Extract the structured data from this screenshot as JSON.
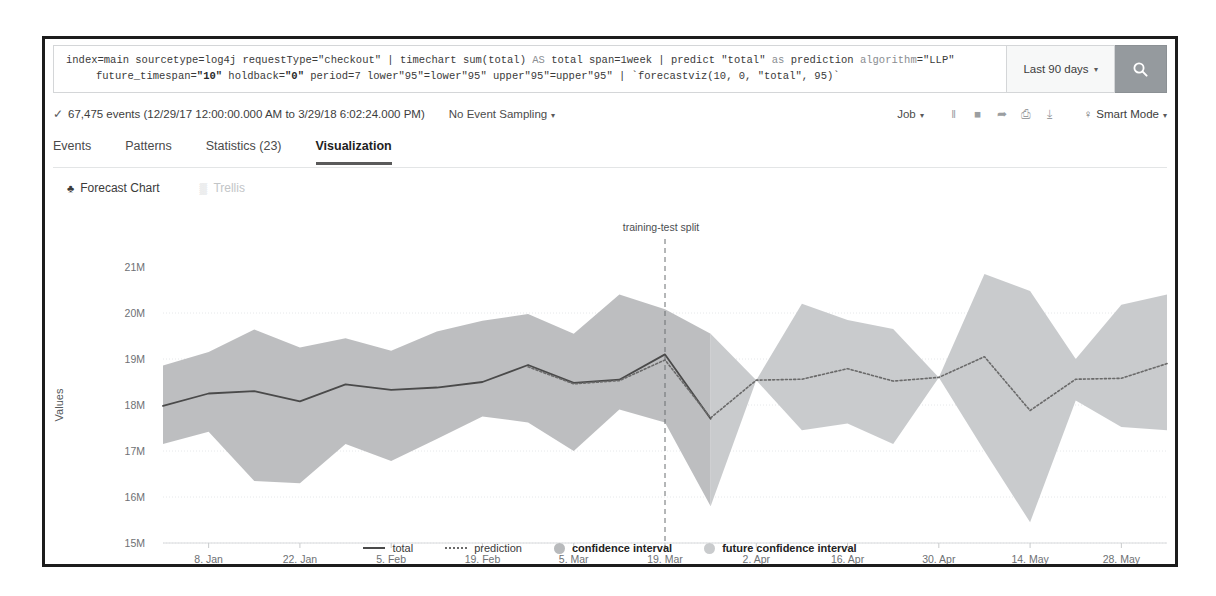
{
  "search": {
    "query_line1_parts": [
      {
        "t": "index=main sourcetype=log4j requestType=\"checkout\" | timechart sum(total) ",
        "c": "normal"
      },
      {
        "t": "AS",
        "c": "kw"
      },
      {
        "t": " total span=1week | predict \"total\" ",
        "c": "normal"
      },
      {
        "t": "as",
        "c": "kw"
      },
      {
        "t": " prediction ",
        "c": "normal"
      },
      {
        "t": "algorithm",
        "c": "kw"
      },
      {
        "t": "=\"LLP\"",
        "c": "normal"
      }
    ],
    "query_line2_parts": [
      {
        "t": "future_timespan=",
        "c": "normal"
      },
      {
        "t": "\"10\"",
        "c": "str"
      },
      {
        "t": " holdback=",
        "c": "normal"
      },
      {
        "t": "\"0\"",
        "c": "str"
      },
      {
        "t": " period=7 lower\"95\"=lower\"95\" upper\"95\"=upper\"95\" | `forecastviz(10, 0, \"total\", 95)`",
        "c": "normal"
      }
    ],
    "query_full": "index=main sourcetype=log4j requestType=\"checkout\" | timechart sum(total) AS total span=1week | predict \"total\" as prediction algorithm=\"LLP\" future_timespan=\"10\" holdback=\"0\" period=7 lower\"95\"=lower\"95\" upper\"95\"=upper\"95\" | `forecastviz(10, 0, \"total\", 95)`",
    "time_range_label": "Last 90 days",
    "time_range_caret": "▾",
    "search_icon": "magnifier-icon"
  },
  "jobbar": {
    "check_glyph": "✓",
    "events_text": "67,475 events (12/29/17 12:00:00.000 AM to 3/29/18 6:02:24.000 PM)",
    "sampling_label": "No Event Sampling",
    "sampling_caret": "▾",
    "job_label": "Job",
    "job_caret": "▾",
    "icons": [
      {
        "name": "pause-icon",
        "glyph": "‖"
      },
      {
        "name": "stop-icon",
        "glyph": "■"
      },
      {
        "name": "share-icon",
        "glyph": "➦"
      },
      {
        "name": "print-icon",
        "glyph": "⎙"
      },
      {
        "name": "export-icon",
        "glyph": "⤓"
      }
    ],
    "mode_bulb": "♀",
    "mode_label": "Smart Mode",
    "mode_caret": "▾"
  },
  "tabs": [
    {
      "label": "Events",
      "active": false
    },
    {
      "label": "Patterns",
      "active": false
    },
    {
      "label": "Statistics (23)",
      "active": false
    },
    {
      "label": "Visualization",
      "active": true
    }
  ],
  "chart_tools": [
    {
      "label": "Forecast Chart",
      "icon": "forecast-chart-icon",
      "glyph": "♣",
      "muted": false
    },
    {
      "label": "Trellis",
      "icon": "trellis-grid-icon",
      "glyph": "▒",
      "muted": true
    }
  ],
  "legend": [
    {
      "label": "total",
      "kind": "line",
      "bold": false
    },
    {
      "label": "prediction",
      "kind": "dashed",
      "bold": false
    },
    {
      "label": "confidence interval",
      "kind": "dot",
      "bold": true
    },
    {
      "label": "future confidence interval",
      "kind": "dot-future",
      "bold": true
    }
  ],
  "chart_data": {
    "type": "line",
    "title": "",
    "xlabel": "",
    "ylabel": "Values",
    "ylim": [
      15000000,
      21000000
    ],
    "ytick_labels": [
      "21M",
      "20M",
      "19M",
      "18M",
      "17M",
      "16M",
      "15M"
    ],
    "ytick_values": [
      21000000,
      20000000,
      19000000,
      18000000,
      17000000,
      16000000,
      15000000
    ],
    "xtick_labels": [
      "8. Jan",
      "22. Jan",
      "5. Feb",
      "19. Feb",
      "5. Mar",
      "19. Mar",
      "2. Apr",
      "16. Apr",
      "30. Apr",
      "14. May",
      "28. May"
    ],
    "xtick_index": [
      1,
      3,
      5,
      7,
      9,
      11,
      13,
      15,
      17,
      19,
      21
    ],
    "grid": true,
    "legend_position": "bottom",
    "annotations": [
      {
        "text": "training-test split",
        "x_index": 11.0,
        "type": "vline-dashed"
      }
    ],
    "x": [
      "2017-12-25",
      "2018-01-01",
      "2018-01-08",
      "2018-01-15",
      "2018-01-22",
      "2018-01-29",
      "2018-02-05",
      "2018-02-12",
      "2018-02-19",
      "2018-02-26",
      "2018-03-05",
      "2018-03-12",
      "2018-03-19",
      "2018-03-26",
      "2018-04-02",
      "2018-04-09",
      "2018-04-16",
      "2018-04-23",
      "2018-04-30",
      "2018-05-07",
      "2018-05-14",
      "2018-05-21",
      "2018-05-28"
    ],
    "series": [
      {
        "name": "total",
        "style": "solid",
        "values": [
          17980000,
          18250000,
          18300000,
          18080000,
          18450000,
          18330000,
          18380000,
          18500000,
          18870000,
          18480000,
          18550000,
          19100000,
          17700000,
          null,
          null,
          null,
          null,
          null,
          null,
          null,
          null,
          null,
          null
        ]
      },
      {
        "name": "prediction",
        "style": "dotted",
        "values": [
          null,
          null,
          null,
          null,
          null,
          null,
          null,
          null,
          18830000,
          18460000,
          18530000,
          18980000,
          17720000,
          18540000,
          18560000,
          18790000,
          18520000,
          18600000,
          19050000,
          17880000,
          18560000,
          18580000,
          18900000
        ]
      }
    ],
    "bands": [
      {
        "name": "confidence interval",
        "fill": "#b9bbbd",
        "lower": [
          17150000,
          17420000,
          16350000,
          16300000,
          17150000,
          16780000,
          17260000,
          17750000,
          17620000,
          17000000,
          17900000,
          17620000,
          15800000,
          null,
          null,
          null,
          null,
          null,
          null,
          null,
          null,
          null,
          null
        ],
        "upper": [
          18860000,
          19150000,
          19640000,
          19250000,
          19450000,
          19180000,
          19600000,
          19830000,
          19980000,
          19550000,
          20400000,
          20080000,
          19550000,
          null,
          null,
          null,
          null,
          null,
          null,
          null,
          null,
          null,
          null
        ]
      },
      {
        "name": "future confidence interval",
        "fill": "#c6c8ca",
        "lower": [
          null,
          null,
          null,
          null,
          null,
          null,
          null,
          null,
          null,
          null,
          null,
          null,
          15800000,
          18540000,
          17450000,
          17600000,
          17150000,
          18600000,
          17000000,
          15450000,
          18100000,
          17520000,
          17450000
        ],
        "upper": [
          null,
          null,
          null,
          null,
          null,
          null,
          null,
          null,
          null,
          null,
          null,
          null,
          19550000,
          18540000,
          20200000,
          19850000,
          19650000,
          18600000,
          20850000,
          20480000,
          19000000,
          20180000,
          20400000
        ]
      }
    ],
    "colors": {
      "total_line": "#4a4a4a",
      "prediction_line": "#6a6a6a",
      "confidence_band": "#b9bbbd",
      "future_band": "#c6c8ca",
      "grid": "#e6e8ea",
      "split_line": "#6b6e71"
    }
  }
}
